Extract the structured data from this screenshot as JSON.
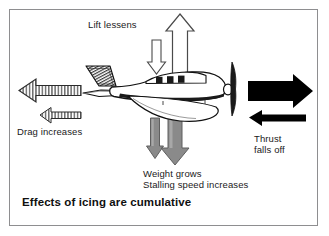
{
  "figure": {
    "title": "Effects of icing are cumulative",
    "background_color": "#ffffff",
    "border_color": "#8e8e90"
  },
  "labels": {
    "lift": "Lift lessens",
    "drag": "Drag increases",
    "thrust": "Thrust\nfalls off",
    "weight": "Weight grows\nStalling speed increases"
  },
  "forces": [
    {
      "id": "lift",
      "name": "Lift",
      "label": "Lift lessens",
      "direction": "up",
      "style": "outline",
      "color": "#ffffff",
      "stroke": "#4a4a4a",
      "arrows": [
        {
          "role": "reduced",
          "size": "small",
          "direction": "down"
        },
        {
          "role": "nominal",
          "size": "large",
          "direction": "up"
        }
      ]
    },
    {
      "id": "drag",
      "name": "Drag",
      "label": "Drag increases",
      "direction": "left",
      "style": "hatched",
      "color": "#9a9a9a",
      "stroke": "#2b2b2b",
      "arrows": [
        {
          "role": "increased",
          "size": "large",
          "direction": "left"
        },
        {
          "role": "nominal",
          "size": "small",
          "direction": "left"
        }
      ]
    },
    {
      "id": "thrust",
      "name": "Thrust",
      "label": "Thrust falls off",
      "direction": "right",
      "style": "solid",
      "color": "#000000",
      "stroke": "#000000",
      "arrows": [
        {
          "role": "nominal",
          "size": "large",
          "direction": "right"
        },
        {
          "role": "reduced",
          "size": "small",
          "direction": "left"
        }
      ]
    },
    {
      "id": "weight",
      "name": "Weight",
      "label": "Weight grows / Stalling speed increases",
      "direction": "down",
      "style": "solid",
      "color": "#8a8a8a",
      "stroke": "#5a5a5a",
      "arrows": [
        {
          "role": "nominal",
          "size": "small",
          "direction": "down"
        },
        {
          "role": "increased",
          "size": "large",
          "direction": "down"
        }
      ]
    }
  ],
  "colors": {
    "ink": "#1a1a1a",
    "gray_arrow": "#8a8a8a",
    "gray_arrow_edge": "#5a5a5a",
    "black_arrow": "#000000",
    "outline_arrow_stroke": "#4a4a4a",
    "hatch_stroke": "#2b2b2b",
    "frame": "#8e8e90",
    "aircraft_line": "#111111",
    "aircraft_fill": "#ffffff",
    "ice_hatch": "#3a3a3a"
  }
}
